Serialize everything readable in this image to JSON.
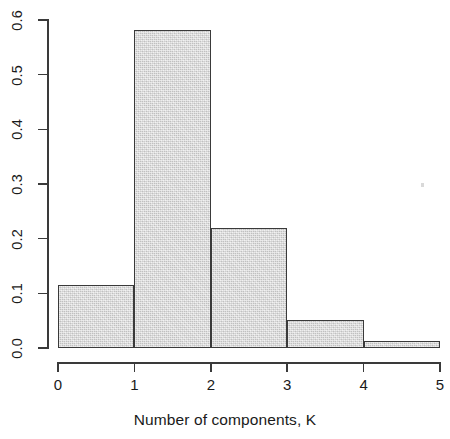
{
  "chart_data": {
    "type": "bar",
    "title": "",
    "subtitle": "",
    "xlabel": "Number of components, K",
    "ylabel": "",
    "categories": [
      "[0,1)",
      "[1,2)",
      "[2,3)",
      "[3,4)",
      "[4,5)"
    ],
    "values": [
      0.115,
      0.582,
      0.22,
      0.051,
      0.013
    ],
    "bin_edges": [
      0,
      1,
      2,
      3,
      4,
      5
    ],
    "bin_width": 1,
    "xlim": [
      0,
      5
    ],
    "ylim": [
      0.0,
      0.6
    ],
    "x_ticks": [
      0,
      1,
      2,
      3,
      4,
      5
    ],
    "x_tick_labels": [
      "0",
      "1",
      "2",
      "3",
      "4",
      "5"
    ],
    "y_ticks": [
      0.0,
      0.1,
      0.2,
      0.3,
      0.4,
      0.5,
      0.6
    ],
    "y_tick_labels": [
      "0.0",
      "0.1",
      "0.2",
      "0.3",
      "0.4",
      "0.5",
      "0.6"
    ],
    "y_tick_labels_rotated": true,
    "grid": false,
    "legend": null,
    "annotations": [],
    "colors": {
      "bar_fill": "#d7d7d7",
      "bar_border": "#3a3a3a",
      "axis": "#3a3a3a",
      "text": "#1a1a1a",
      "background": "#ffffff"
    }
  }
}
